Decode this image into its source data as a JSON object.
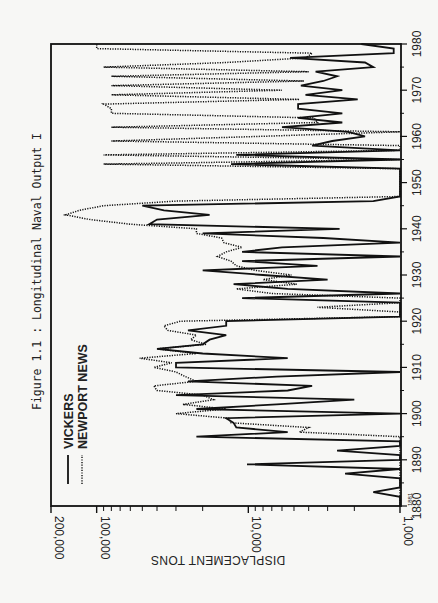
{
  "chart_data": {
    "type": "line",
    "title": "Figure 1.1 : Longitudinal Naval Output I",
    "xlabel": "",
    "ylabel": "DISPLACEMENT TONS",
    "orientation": "rotated-90-counterclockwise",
    "x_range": [
      1880,
      1980
    ],
    "x_ticks": [
      "1880",
      "1890",
      "1900",
      "1910",
      "1920",
      "1930",
      "1940",
      "1950",
      "1960",
      "1970",
      "1980"
    ],
    "x_start_annotation": "1881",
    "y_scale": "log",
    "y_range": [
      1000,
      200000
    ],
    "y_tick_labels": [
      "1,000",
      "10,000",
      "100,000",
      "200,000"
    ],
    "y_minor_ticks": [
      2000,
      3000,
      4000,
      5000,
      6000,
      7000,
      8000,
      9000,
      20000,
      30000,
      40000,
      50000,
      60000,
      70000,
      80000,
      90000
    ],
    "legend": {
      "placement": "top-left",
      "entries": [
        {
          "name": "VICKERS",
          "style": "solid"
        },
        {
          "name": "NEWPORT NEWS",
          "style": "dotted"
        }
      ]
    },
    "series": [
      {
        "name": "VICKERS",
        "style": "solid",
        "points": [
          [
            1880,
            1000
          ],
          [
            1882,
            1000
          ],
          [
            1883,
            1500
          ],
          [
            1884,
            1000
          ],
          [
            1886,
            1000
          ],
          [
            1887,
            2300
          ],
          [
            1888,
            1000
          ],
          [
            1889,
            10200
          ],
          [
            1890,
            1000
          ],
          [
            1891,
            1000
          ],
          [
            1892,
            2600
          ],
          [
            1893,
            1000
          ],
          [
            1894,
            1000
          ],
          [
            1895,
            22000
          ],
          [
            1896,
            5500
          ],
          [
            1897,
            12000
          ],
          [
            1898,
            12500
          ],
          [
            1899,
            14000
          ],
          [
            1900,
            1000
          ],
          [
            1901,
            22000
          ],
          [
            1902,
            6500
          ],
          [
            1903,
            2000
          ],
          [
            1904,
            30000
          ],
          [
            1905,
            5500
          ],
          [
            1906,
            3800
          ],
          [
            1907,
            25000
          ],
          [
            1908,
            6500
          ],
          [
            1909,
            1000
          ],
          [
            1910,
            30000
          ],
          [
            1911,
            30000
          ],
          [
            1912,
            5500
          ],
          [
            1913,
            20000
          ],
          [
            1914,
            40000
          ],
          [
            1915,
            20000
          ],
          [
            1916,
            18000
          ],
          [
            1917,
            14000
          ],
          [
            1918,
            25000
          ],
          [
            1919,
            14000
          ],
          [
            1920,
            14000
          ],
          [
            1921,
            1000
          ],
          [
            1924,
            1000
          ],
          [
            1925,
            11000
          ],
          [
            1926,
            1000
          ],
          [
            1927,
            5500
          ],
          [
            1928,
            12500
          ],
          [
            1929,
            3000
          ],
          [
            1930,
            8000
          ],
          [
            1931,
            20000
          ],
          [
            1932,
            3500
          ],
          [
            1933,
            11000
          ],
          [
            1934,
            1000
          ],
          [
            1935,
            11000
          ],
          [
            1936,
            6000
          ],
          [
            1937,
            1000
          ],
          [
            1938,
            3200
          ],
          [
            1939,
            20000
          ],
          [
            1940,
            2500
          ],
          [
            1941,
            45000
          ],
          [
            1942,
            40000
          ],
          [
            1943,
            18000
          ],
          [
            1944,
            36000
          ],
          [
            1945,
            50000
          ],
          [
            1946,
            1500
          ],
          [
            1947,
            1000
          ],
          [
            1950,
            1000
          ],
          [
            1953,
            1000
          ],
          [
            1954,
            13000
          ],
          [
            1955,
            1000
          ],
          [
            1956,
            12000
          ],
          [
            1957,
            1000
          ],
          [
            1958,
            3800
          ],
          [
            1959,
            2800
          ],
          [
            1960,
            1700
          ],
          [
            1961,
            2200
          ],
          [
            1962,
            6000
          ],
          [
            1963,
            2400
          ],
          [
            1964,
            4700
          ],
          [
            1965,
            2400
          ],
          [
            1966,
            4700
          ],
          [
            1967,
            4700
          ],
          [
            1968,
            1900
          ],
          [
            1969,
            4200
          ],
          [
            1970,
            2400
          ],
          [
            1971,
            4500
          ],
          [
            1972,
            3200
          ],
          [
            1973,
            2600
          ],
          [
            1974,
            3600
          ],
          [
            1975,
            1500
          ],
          [
            1976,
            1700
          ],
          [
            1977,
            5300
          ],
          [
            1978,
            1100
          ],
          [
            1979,
            1100
          ],
          [
            1980,
            1800
          ]
        ]
      },
      {
        "name": "NEWPORT NEWS",
        "style": "dotted",
        "points": [
          [
            1880,
            1000
          ],
          [
            1895,
            1000
          ],
          [
            1896,
            4600
          ],
          [
            1897,
            4000
          ],
          [
            1898,
            13000
          ],
          [
            1899,
            13500
          ],
          [
            1900,
            30000
          ],
          [
            1901,
            14000
          ],
          [
            1902,
            27000
          ],
          [
            1903,
            17000
          ],
          [
            1904,
            20000
          ],
          [
            1905,
            40000
          ],
          [
            1906,
            42000
          ],
          [
            1907,
            22000
          ],
          [
            1908,
            26000
          ],
          [
            1909,
            30000
          ],
          [
            1910,
            42000
          ],
          [
            1911,
            32000
          ],
          [
            1912,
            52000
          ],
          [
            1913,
            22000
          ],
          [
            1914,
            40000
          ],
          [
            1915,
            19000
          ],
          [
            1916,
            24000
          ],
          [
            1917,
            22000
          ],
          [
            1918,
            34000
          ],
          [
            1919,
            36000
          ],
          [
            1920,
            28000
          ],
          [
            1921,
            1000
          ],
          [
            1922,
            1000
          ],
          [
            1923,
            3500
          ],
          [
            1924,
            1000
          ],
          [
            1925,
            1000
          ],
          [
            1926,
            7000
          ],
          [
            1927,
            12000
          ],
          [
            1928,
            4800
          ],
          [
            1929,
            8000
          ],
          [
            1930,
            5200
          ],
          [
            1931,
            9000
          ],
          [
            1932,
            12000
          ],
          [
            1933,
            13000
          ],
          [
            1934,
            16000
          ],
          [
            1935,
            14000
          ],
          [
            1936,
            11000
          ],
          [
            1937,
            14500
          ],
          [
            1938,
            15000
          ],
          [
            1939,
            22000
          ],
          [
            1940,
            22000
          ],
          [
            1941,
            60000
          ],
          [
            1942,
            110000
          ],
          [
            1943,
            160000
          ],
          [
            1944,
            130000
          ],
          [
            1945,
            90000
          ],
          [
            1946,
            30000
          ],
          [
            1947,
            1000
          ],
          [
            1953,
            1000
          ],
          [
            1954,
            90000
          ],
          [
            1955,
            1000
          ],
          [
            1956,
            90000
          ],
          [
            1957,
            1000
          ],
          [
            1958,
            1000
          ],
          [
            1959,
            80000
          ],
          [
            1960,
            8500
          ],
          [
            1961,
            1000
          ],
          [
            1962,
            80000
          ],
          [
            1963,
            3500
          ],
          [
            1964,
            3700
          ],
          [
            1965,
            80000
          ],
          [
            1966,
            80000
          ],
          [
            1967,
            90000
          ],
          [
            1968,
            4600
          ],
          [
            1969,
            80000
          ],
          [
            1970,
            6000
          ],
          [
            1971,
            80000
          ],
          [
            1972,
            4300
          ],
          [
            1973,
            80000
          ],
          [
            1974,
            4000
          ],
          [
            1975,
            90000
          ],
          [
            1976,
            14000
          ],
          [
            1977,
            4200
          ],
          [
            1978,
            3800
          ],
          [
            1979,
            100000
          ],
          [
            1980,
            100000
          ]
        ]
      }
    ]
  }
}
